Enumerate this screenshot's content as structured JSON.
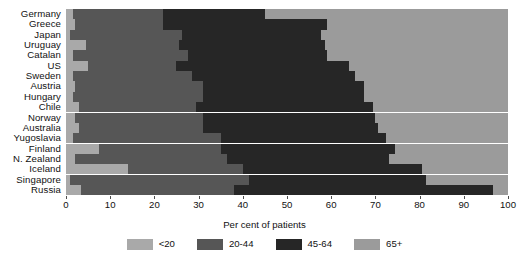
{
  "chart_data": {
    "type": "bar",
    "orientation": "horizontal",
    "stacked": true,
    "stack_mode": "percent",
    "title": "",
    "subtitle": "",
    "xlabel": "Per cent of patients",
    "ylabel": "",
    "xlim": [
      0,
      100
    ],
    "ylim": null,
    "grid": false,
    "legend_position": "bottom-center",
    "legend": [
      "<20",
      "20-44",
      "45-64",
      "65+"
    ],
    "tick_labels": [
      "0",
      "10",
      "20",
      "30",
      "40",
      "50",
      "60",
      "70",
      "80",
      "90",
      "100"
    ],
    "ticks": [
      0,
      10,
      20,
      30,
      40,
      50,
      60,
      70,
      80,
      90,
      100
    ],
    "colors": {
      "<20": "#a9a9a9",
      "20-44": "#565656",
      "45-64": "#262626",
      "65+": "#9b9b9b"
    },
    "categories": [
      "Germany",
      "Greece",
      "Japan",
      "Uruguay",
      "Catalan",
      "US",
      "Sweden",
      "Austria",
      "Hungary",
      "Chile",
      "Norway",
      "Australia",
      "Yugoslavia",
      "Finland",
      "N. Zealand",
      "Iceland",
      "Singapore",
      "Russia"
    ],
    "series": [
      {
        "name": "<20",
        "values": [
          1.5,
          2.0,
          0.8,
          4.5,
          1.5,
          5.0,
          1.5,
          2.0,
          1.5,
          3.0,
          2.0,
          3.0,
          1.5,
          7.5,
          2.0,
          14.0,
          1.0,
          3.5
        ]
      },
      {
        "name": "20-44",
        "values": [
          20.5,
          20.0,
          25.5,
          21.0,
          26.0,
          20.0,
          27.0,
          29.0,
          29.5,
          26.5,
          29.0,
          28.0,
          33.5,
          27.5,
          34.5,
          26.0,
          40.5,
          34.5
        ]
      },
      {
        "name": "45-64",
        "values": [
          23.0,
          37.0,
          31.5,
          33.0,
          31.5,
          39.0,
          37.0,
          36.5,
          36.5,
          40.0,
          39.0,
          39.5,
          37.5,
          39.5,
          36.5,
          40.5,
          40.0,
          58.5
        ]
      },
      {
        "name": "65+",
        "values": [
          55.0,
          41.0,
          42.2,
          41.5,
          41.0,
          36.0,
          34.5,
          32.5,
          32.5,
          30.5,
          30.0,
          29.5,
          27.5,
          25.5,
          27.0,
          19.5,
          18.5,
          3.5
        ]
      }
    ]
  }
}
